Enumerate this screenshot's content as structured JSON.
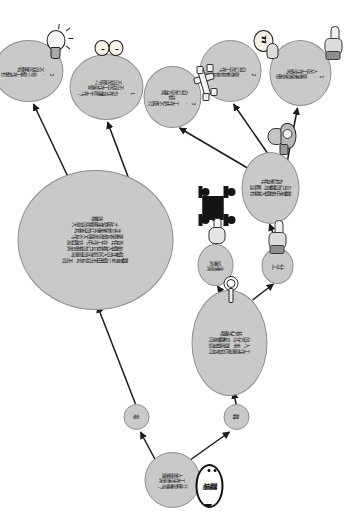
{
  "diagram": {
    "orientation": "rotated-90",
    "background_color": "#ffffff",
    "node_fill_color": "#c9c9c9",
    "node_border_color": "#8e8e8e",
    "link_color": "#1b1b1b"
  },
  "balloon": {
    "name": "speech-balloon",
    "text": "職場"
  },
  "nodes": {
    "root": {
      "label": "什麼是職場？\n工作環境與\n人際關係",
      "icon": "speech-balloon-icon"
    },
    "branch_left": {
      "label": "職"
    },
    "branch_right": {
      "label": "場"
    },
    "mid": {
      "label": "工作環境所包含的\n人、事、物與相處\n的方式，是職場的\n核心議題。",
      "icon": "key-hook-icon"
    },
    "big": {
      "label": "職場是一個由不同背景、不同\n個性的人所組成的環境，\n每個人都有自己的角色與\n責任。在工作中，我們需\n要學會如何與他人合作，\n並且尊重彼此的差異，\n才能發揮團隊的最大\n效枛。",
      "icon": "meeting-people-icon"
    },
    "small_a": {
      "label": "分工",
      "icon": "hand-icon"
    },
    "small_b": {
      "label": "溝通與\n協調",
      "icon": "pointing-hand-icon"
    },
    "core": {
      "label": "職場中每個人都有\n自己的職責，應該\n負起責任。",
      "icon": "desk-lamp-icon"
    },
    "item1": {
      "label": "1. 要懂得尊重他\n人的工作成果。",
      "icon": "pointing-hand-icon"
    },
    "item2": {
      "label": "2. 要認真負責完成\n自己的工作。",
      "icon": "face-thinking-icon"
    },
    "item3": {
      "label": "3. 工作時不能只顧\n自己的方便。",
      "icon": "broken-plane-icon"
    },
    "right1": {
      "label": "1. 您作過哪些工作？\n不同的工作需要\n不同的能力。",
      "icon": "two-heads-icon"
    },
    "right2": {
      "label": "2. 每一個工作都有\n不同的挑戰。",
      "icon": "light-bulb-icon"
    }
  }
}
